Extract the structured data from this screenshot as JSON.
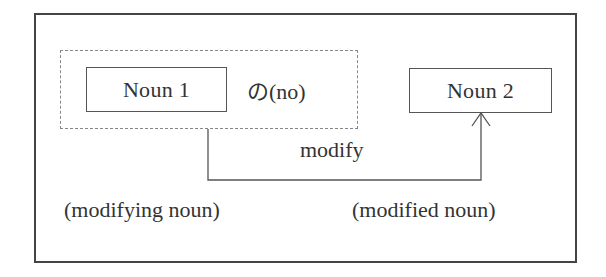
{
  "diagram": {
    "nodes": {
      "noun1": "Noun 1",
      "particle": "の(no)",
      "noun2": "Noun 2"
    },
    "edge_label": "modify",
    "roles": {
      "left": "(modifying noun)",
      "right": "(modified noun)"
    },
    "colors": {
      "frame": "#444444",
      "dashed_group": "#888888",
      "box_border": "#555555",
      "text": "#333333",
      "connector": "#555555"
    }
  }
}
